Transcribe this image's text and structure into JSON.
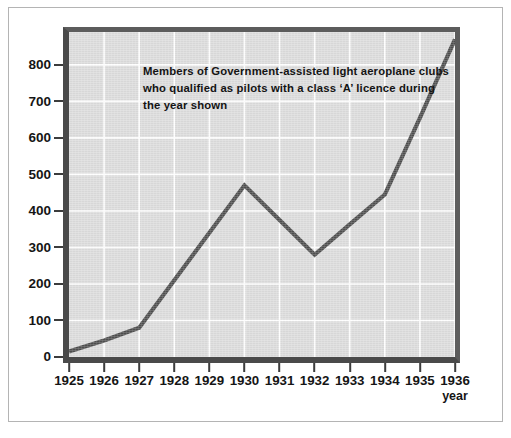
{
  "chart_data": {
    "type": "line",
    "title": "Members of Government-assisted light aeroplane clubs\nwho qualified as pilots with a class ‘A’ licence during\nthe year shown",
    "xlabel": "year",
    "ylabel": "",
    "categories": [
      "1925",
      "1926",
      "1927",
      "1928",
      "1929",
      "1930",
      "1931",
      "1932",
      "1933",
      "1934",
      "1935",
      "1936"
    ],
    "values": [
      15,
      45,
      80,
      210,
      340,
      470,
      375,
      280,
      363,
      445,
      655,
      870
    ],
    "x": [
      1925,
      1926,
      1927,
      1928,
      1929,
      1930,
      1931,
      1932,
      1933,
      1934,
      1935,
      1936
    ],
    "xlim": [
      1925,
      1936
    ],
    "ylim": [
      0,
      890
    ],
    "y_ticks": [
      0,
      100,
      200,
      300,
      400,
      500,
      600,
      700,
      800
    ],
    "y_tick_labels": [
      "0",
      "100",
      "200",
      "300",
      "400",
      "500",
      "600",
      "700",
      "800"
    ],
    "grid": true,
    "grid_color": "#ffffff",
    "legend": false,
    "legend_position": "none",
    "plot_background": "#dcdcdc",
    "line_color": "#4f4f4f",
    "axis_color": "#3c3c3c",
    "text_color": "#151515",
    "vertex_years": [
      "1925",
      "1927",
      "1930",
      "1932",
      "1934",
      "1936"
    ]
  }
}
